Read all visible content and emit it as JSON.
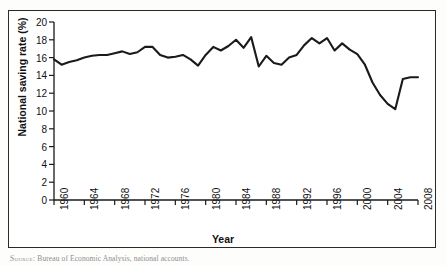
{
  "figure": {
    "background_color": "#ffffff",
    "frame_color": "#2a2a2a",
    "line_color": "#1a1a1a"
  },
  "axes": {
    "ylabel": "National saving rate (%)",
    "xlabel": "Year",
    "yticks": [
      "0",
      "2",
      "4",
      "6",
      "8",
      "10",
      "12",
      "14",
      "16",
      "18",
      "20"
    ],
    "xticks": [
      "1960",
      "1964",
      "1968",
      "1972",
      "1976",
      "1980",
      "1984",
      "1988",
      "1992",
      "1996",
      "2000",
      "2004",
      "2008"
    ]
  },
  "source": {
    "prefix": "Source:",
    "text": "Bureau of Economic Analysis, national accounts."
  },
  "chart_data": {
    "type": "line",
    "title": "",
    "subtitle": "",
    "xlabel": "Year",
    "ylabel": "National saving rate (%)",
    "xlim": [
      1960,
      2008
    ],
    "ylim": [
      0,
      20
    ],
    "xtick_values": [
      1960,
      1964,
      1968,
      1972,
      1976,
      1980,
      1984,
      1988,
      1992,
      1996,
      2000,
      2004,
      2008
    ],
    "ytick_values": [
      0,
      2,
      4,
      6,
      8,
      10,
      12,
      14,
      16,
      18,
      20
    ],
    "grid": false,
    "legend": null,
    "series": [
      {
        "name": "National saving rate",
        "color": "#1a1a1a",
        "x": [
          1960,
          1961,
          1962,
          1963,
          1964,
          1965,
          1966,
          1967,
          1968,
          1969,
          1970,
          1971,
          1972,
          1973,
          1974,
          1975,
          1976,
          1977,
          1978,
          1979,
          1980,
          1981,
          1982,
          1983,
          1984,
          1985,
          1986,
          1987,
          1988,
          1989,
          1990,
          1991,
          1992,
          1993,
          1994,
          1995,
          1996,
          1997,
          1998,
          1999,
          2000,
          2001,
          2002,
          2003,
          2004,
          2005,
          2006,
          2007,
          2008
        ],
        "values": [
          15.8,
          15.2,
          15.5,
          15.6,
          16.0,
          16.2,
          16.3,
          16.4,
          16.5,
          16.8,
          17.0,
          17.2,
          17.2,
          16.6,
          16.2,
          16.1,
          15.9,
          16.1,
          15.4,
          16.0,
          17.0,
          17.4,
          18.0,
          17.2,
          18.2,
          18.3,
          16.5,
          15.0,
          15.7,
          16.2,
          15.9,
          15.7,
          17.2,
          16.2,
          15.5,
          15.4,
          15.0,
          15.3,
          15.3,
          15.0,
          15.5,
          16.1,
          16.3,
          16.6,
          17.4,
          18.2,
          17.8,
          17.4,
          17.0
        ],
        "note_peak": 18.3,
        "note_min": 10.2
      }
    ],
    "data_points": [
      {
        "year": 1960,
        "value": 15.8
      },
      {
        "year": 1961,
        "value": 15.2
      },
      {
        "year": 1962,
        "value": 15.5
      },
      {
        "year": 1963,
        "value": 15.7
      },
      {
        "year": 1964,
        "value": 16.0
      },
      {
        "year": 1965,
        "value": 16.2
      },
      {
        "year": 1966,
        "value": 16.3
      },
      {
        "year": 1967,
        "value": 16.3
      },
      {
        "year": 1968,
        "value": 16.5
      },
      {
        "year": 1969,
        "value": 16.7
      },
      {
        "year": 1970,
        "value": 16.4
      },
      {
        "year": 1971,
        "value": 16.6
      },
      {
        "year": 1972,
        "value": 17.2
      },
      {
        "year": 1973,
        "value": 17.2
      },
      {
        "year": 1974,
        "value": 16.3
      },
      {
        "year": 1975,
        "value": 16.0
      },
      {
        "year": 1976,
        "value": 16.1
      },
      {
        "year": 1977,
        "value": 16.3
      },
      {
        "year": 1978,
        "value": 15.8
      },
      {
        "year": 1979,
        "value": 15.1
      },
      {
        "year": 1980,
        "value": 16.3
      },
      {
        "year": 1981,
        "value": 17.2
      },
      {
        "year": 1982,
        "value": 16.8
      },
      {
        "year": 1983,
        "value": 17.3
      },
      {
        "year": 1984,
        "value": 18.0
      },
      {
        "year": 1985,
        "value": 17.1
      },
      {
        "year": 1986,
        "value": 18.3
      },
      {
        "year": 1987,
        "value": 15.0
      },
      {
        "year": 1988,
        "value": 16.2
      },
      {
        "year": 1989,
        "value": 15.4
      },
      {
        "year": 1990,
        "value": 15.2
      },
      {
        "year": 1991,
        "value": 16.0
      },
      {
        "year": 1992,
        "value": 16.3
      },
      {
        "year": 1993,
        "value": 17.4
      },
      {
        "year": 1994,
        "value": 18.2
      },
      {
        "year": 1995,
        "value": 17.6
      },
      {
        "year": 1996,
        "value": 18.2
      },
      {
        "year": 1997,
        "value": 16.8
      },
      {
        "year": 1998,
        "value": 17.6
      },
      {
        "year": 1999,
        "value": 16.9
      },
      {
        "year": 2000,
        "value": 16.4
      },
      {
        "year": 2001,
        "value": 15.2
      },
      {
        "year": 2002,
        "value": 13.2
      },
      {
        "year": 2003,
        "value": 11.8
      },
      {
        "year": 2004,
        "value": 10.8
      },
      {
        "year": 2005,
        "value": 10.2
      },
      {
        "year": 2006,
        "value": 13.6
      },
      {
        "year": 2007,
        "value": 13.8
      },
      {
        "year": 2008,
        "value": 13.8
      }
    ]
  }
}
